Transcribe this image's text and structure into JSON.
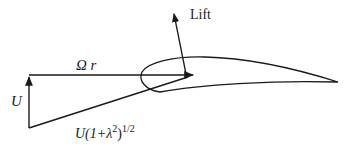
{
  "diagram": {
    "colors": {
      "stroke": "#1a1a1a",
      "background": "#ffffff"
    },
    "labels": {
      "lift": "Lift",
      "rotational_velocity": {
        "symbol": "Ω",
        "variable": "r"
      },
      "axial_velocity": "U",
      "resultant_velocity": {
        "prefix": "U(1+λ",
        "exp1": "2",
        "mid": ")",
        "exp2": "1/2"
      }
    },
    "elements": [
      {
        "id": "omega-r-arrow",
        "type": "arrow",
        "from": [
          29,
          75
        ],
        "to": [
          195,
          75
        ]
      },
      {
        "id": "u-arrow",
        "type": "arrow",
        "from": [
          29,
          128
        ],
        "to": [
          29,
          75
        ]
      },
      {
        "id": "resultant-line",
        "type": "line",
        "from": [
          29,
          128
        ],
        "to": [
          192,
          76
        ]
      },
      {
        "id": "lift-arrow",
        "type": "arrow",
        "from": [
          185,
          75
        ],
        "to": [
          173,
          12
        ]
      },
      {
        "id": "airfoil",
        "type": "shape",
        "leading_edge": [
          142,
          75
        ],
        "trailing_edge": [
          338,
          82
        ]
      }
    ]
  }
}
